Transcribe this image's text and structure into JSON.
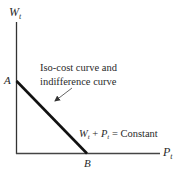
{
  "diagram": {
    "y_axis_label": {
      "main": "W",
      "sub": "t"
    },
    "x_axis_label": {
      "main": "P",
      "sub": "t"
    },
    "point_a_label": "A",
    "point_b_label": "B",
    "curve_caption_line1": "Iso-cost curve and",
    "curve_caption_line2": "indifference curve",
    "equation": {
      "w_main": "W",
      "w_sub": "t",
      "plus": " + ",
      "p_main": "P",
      "p_sub": "t",
      "rest": " = Constant"
    },
    "colors": {
      "axis": "#333333",
      "curve": "#111111",
      "arrow": "#555555"
    }
  }
}
